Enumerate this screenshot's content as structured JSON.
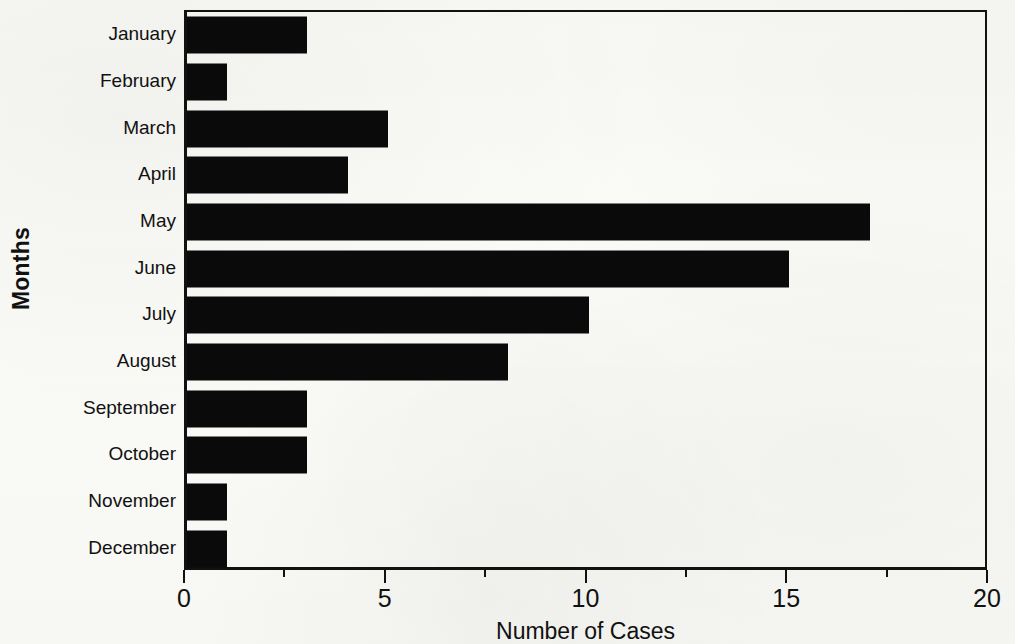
{
  "chart_data": {
    "type": "bar",
    "orientation": "horizontal",
    "title": "",
    "xlabel": "Number of Cases",
    "ylabel": "Months",
    "categories": [
      "January",
      "February",
      "March",
      "April",
      "May",
      "June",
      "July",
      "August",
      "September",
      "October",
      "November",
      "December"
    ],
    "values": [
      3,
      1,
      5,
      4,
      17,
      15,
      10,
      8,
      3,
      3,
      1,
      1
    ],
    "series": [
      {
        "name": "Number of Cases",
        "values": [
          3,
          1,
          5,
          4,
          17,
          15,
          10,
          8,
          3,
          3,
          1,
          1
        ]
      }
    ],
    "xlim": [
      0,
      20
    ],
    "x_major_ticks": [
      0,
      5,
      10,
      15,
      20
    ],
    "x_minor_ticks": [
      2.5,
      7.5,
      12.5,
      17.5
    ],
    "x_tick_labels": [
      "0",
      "5",
      "10",
      "15",
      "20"
    ],
    "grid": false,
    "legend": null,
    "legend_position": "none",
    "bar_color": "#0a0a0a",
    "axis_color": "#111111",
    "background_color": "#fbfbf8"
  },
  "axes": {
    "y_title": "Months",
    "x_title": "Number of Cases"
  }
}
